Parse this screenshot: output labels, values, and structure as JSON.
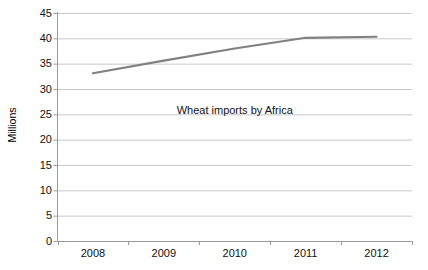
{
  "chart_data": {
    "type": "line",
    "title": "",
    "subtitle": "",
    "xlabel": "",
    "ylabel": "Millions",
    "categories": [
      "2008",
      "2009",
      "2010",
      "2011",
      "2012"
    ],
    "series": [
      {
        "name": "Wheat imports by Africa",
        "values": [
          33.1,
          35.6,
          38.0,
          40.1,
          40.3
        ],
        "color": "#808080"
      }
    ],
    "ylim": [
      0,
      45
    ],
    "yticks": [
      0,
      5,
      10,
      15,
      20,
      25,
      30,
      35,
      40,
      45
    ],
    "ytick_labels": [
      "0",
      "5",
      "10",
      "15",
      "20",
      "25",
      "30",
      "35",
      "40",
      "45"
    ],
    "grid": {
      "horizontal": true,
      "vertical": false,
      "color": "#c8c8c8"
    },
    "legend": {
      "visible": false,
      "position": "none"
    },
    "annotations": [
      {
        "text": "Wheat imports by Africa",
        "x_category": "2010",
        "y_value": 25.8
      }
    ],
    "axes": {
      "line_color": "#9a9a9a",
      "tick_color": "#9a9a9a",
      "y_axis_visible": true,
      "x_axis_visible": true,
      "plot_background": "#ffffff"
    }
  }
}
